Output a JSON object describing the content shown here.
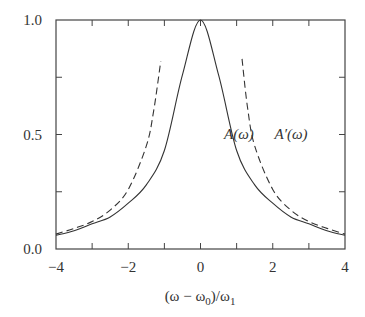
{
  "chart_data": {
    "type": "line",
    "title": "",
    "xlabel": "(ω − ω0)/ω1",
    "xlabel_parts": {
      "main": "(ω − ω",
      "sub0": "0",
      "mid": ")/ω",
      "sub1": "1"
    },
    "ylabel": "",
    "xlim": [
      -4,
      4
    ],
    "ylim": [
      0,
      1
    ],
    "x_ticks": [
      -4,
      -2,
      0,
      2,
      4
    ],
    "x_tick_labels": [
      "−4",
      "−2",
      "0",
      "2",
      "4"
    ],
    "x_minor_ticks": [
      -3,
      -1,
      1,
      3
    ],
    "y_ticks": [
      0,
      0.5,
      1
    ],
    "y_tick_labels": [
      "0.0",
      "0.5",
      "1.0"
    ],
    "y_minor_ticks": [
      0.25,
      0.75
    ],
    "grid": false,
    "legend": "none",
    "series": [
      {
        "name": "A(ω)",
        "style": "solid",
        "color": "#333333",
        "x": [
          -4,
          -3.5,
          -3,
          -2.5,
          -2,
          -1.5,
          -1,
          -0.5,
          0,
          0.5,
          1,
          1.5,
          2,
          2.5,
          3,
          3.5,
          4
        ],
        "y": [
          0.06,
          0.08,
          0.11,
          0.14,
          0.2,
          0.28,
          0.43,
          0.76,
          1.0,
          0.76,
          0.43,
          0.28,
          0.2,
          0.14,
          0.11,
          0.08,
          0.06
        ]
      },
      {
        "name": "A′(ω) left branch",
        "style": "dashed",
        "color": "#333333",
        "x": [
          -4,
          -3.5,
          -3,
          -2.5,
          -2,
          -1.5,
          -1.3,
          -1.1
        ],
        "y": [
          0.065,
          0.09,
          0.12,
          0.17,
          0.26,
          0.45,
          0.6,
          0.82
        ]
      },
      {
        "name": "A′(ω) right branch",
        "style": "dashed",
        "color": "#333333",
        "x": [
          1.15,
          1.3,
          1.5,
          2,
          2.5,
          3,
          3.5,
          4
        ],
        "y": [
          0.83,
          0.62,
          0.45,
          0.26,
          0.17,
          0.12,
          0.09,
          0.065
        ]
      }
    ],
    "annotations": [
      {
        "text": "A(ω)",
        "x": 0.65,
        "y": 0.48
      },
      {
        "text": "A′(ω)",
        "x": 2.05,
        "y": 0.48
      }
    ]
  }
}
